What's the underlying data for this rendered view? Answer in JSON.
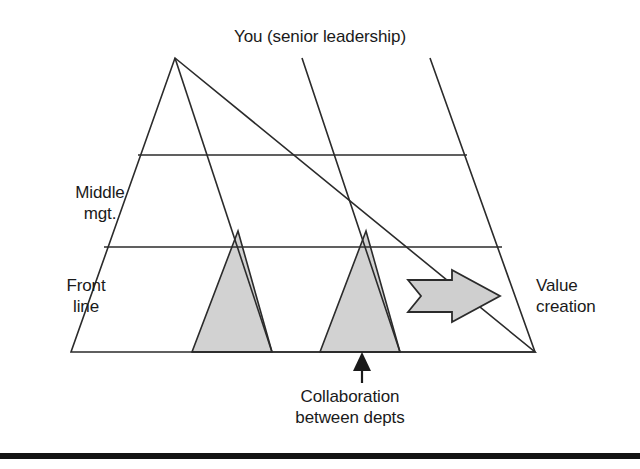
{
  "figure": {
    "type": "nested-triangles-pyramid-diagram",
    "background_color": "#ffffff",
    "line_color": "#2b2b2b",
    "shade_color": "#d2d2d2",
    "arrow_fill": "#cfcfcf",
    "rule_color": "#141414",
    "title": "You (senior leadership)",
    "labels": {
      "top": "You (senior leadership)",
      "middle_tier": "Middle\nmgt.",
      "bottom_tier": "Front\nline",
      "right": "Value\ncreation",
      "callout": "Collaboration\nbetween depts"
    },
    "tiers": [
      {
        "name": "senior-leadership",
        "label": "You (senior leadership)"
      },
      {
        "name": "middle-management",
        "label": "Middle mgt."
      },
      {
        "name": "front-line",
        "label": "Front line"
      }
    ],
    "annotations": [
      {
        "name": "value-creation-arrow",
        "label": "Value creation",
        "direction": "right"
      },
      {
        "name": "collaboration-callout",
        "label": "Collaboration between depts",
        "direction": "up"
      }
    ],
    "shaded_regions": 2,
    "triangle_count": 3
  }
}
